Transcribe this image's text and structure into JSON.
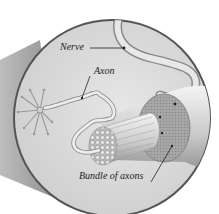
{
  "figure": {
    "kind": "anatomical-illustration",
    "colors": {
      "background": "#ffffff",
      "circle_fill": "#d9d9d9",
      "circle_border": "#555555",
      "cone_shadow": "#9a9a9a",
      "text": "#1e1e1e"
    }
  },
  "labels": {
    "nerve": "Nerve",
    "axon": "Axon",
    "bundle": "Bundle of axons"
  }
}
